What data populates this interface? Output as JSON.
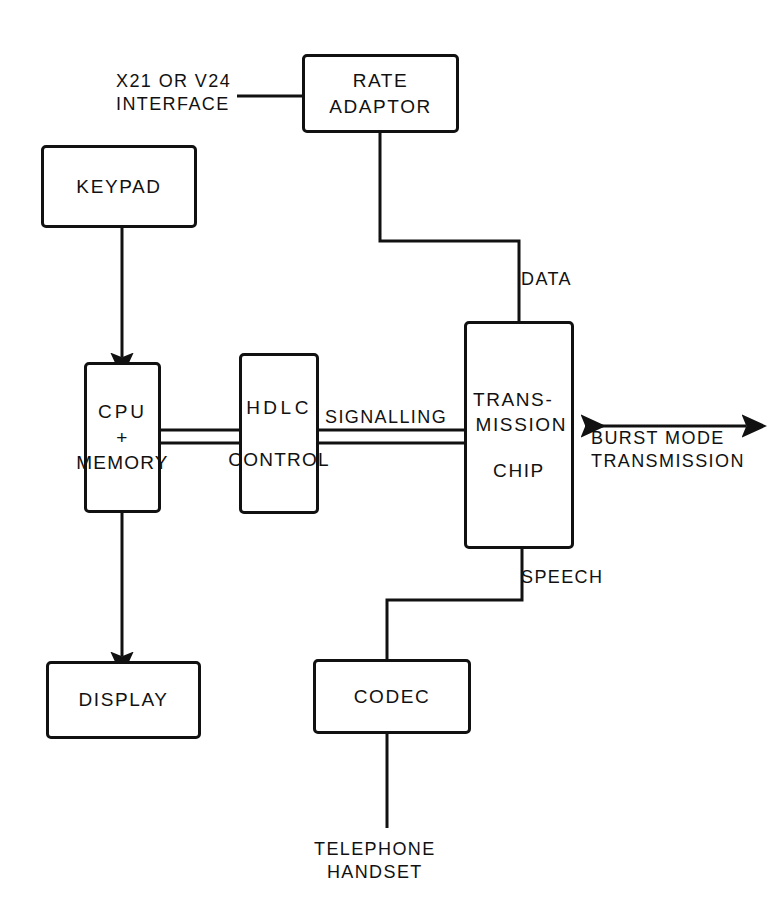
{
  "diagram": {
    "type": "block-diagram",
    "background_color": "#ffffff",
    "line_color": "#111111",
    "boxes": [
      {
        "id": "rate-adaptor",
        "lines": [
          "RATE",
          "ADAPTOR"
        ]
      },
      {
        "id": "keypad",
        "lines": [
          "KEYPAD"
        ]
      },
      {
        "id": "cpu",
        "lines": [
          "CPU",
          "+",
          "MEMORY"
        ]
      },
      {
        "id": "hdlc",
        "lines": [
          "HDLC",
          "CONTROL"
        ]
      },
      {
        "id": "transmission",
        "lines": [
          "TRANS-",
          "MISSION",
          "CHIP"
        ]
      },
      {
        "id": "display",
        "lines": [
          "DISPLAY"
        ]
      },
      {
        "id": "codec",
        "lines": [
          "CODEC"
        ]
      }
    ],
    "labels": {
      "interface_line1": "X21 OR V24",
      "interface_line2": "INTERFACE",
      "data": "DATA",
      "signalling": "SIGNALLING",
      "burst_line1": "BURST MODE",
      "burst_line2": "TRANSMISSION",
      "speech": "SPEECH",
      "handset_line1": "TELEPHONE",
      "handset_line2": "HANDSET"
    },
    "connections": [
      {
        "from": "x21-v24-interface",
        "to": "rate-adaptor",
        "style": "plain"
      },
      {
        "from": "rate-adaptor",
        "to": "transmission",
        "style": "plain",
        "label": "DATA"
      },
      {
        "from": "keypad",
        "to": "cpu",
        "style": "arrow"
      },
      {
        "from": "cpu",
        "to": "hdlc",
        "style": "bus"
      },
      {
        "from": "hdlc",
        "to": "transmission",
        "style": "bus",
        "label": "SIGNALLING"
      },
      {
        "from": "cpu",
        "to": "display",
        "style": "arrow"
      },
      {
        "from": "transmission",
        "to": "codec",
        "style": "plain",
        "label": "SPEECH"
      },
      {
        "from": "codec",
        "to": "telephone-handset",
        "style": "plain"
      },
      {
        "from": "transmission",
        "to": "line",
        "style": "double-arrow",
        "label": "BURST MODE TRANSMISSION"
      }
    ]
  }
}
